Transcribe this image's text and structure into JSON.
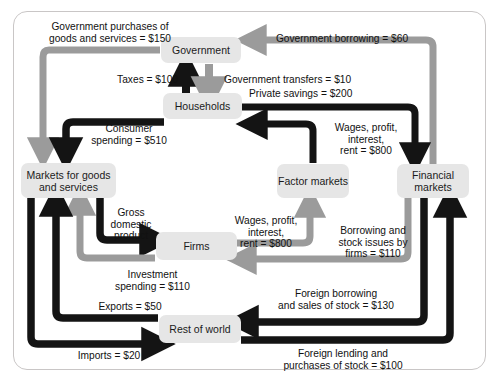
{
  "diagram": {
    "colors": {
      "dark_flow": "#141414",
      "gray_flow": "#9b9b9b",
      "node_fill": "#e6e6e6",
      "border": "#c9c6c6",
      "text": "#111111"
    },
    "nodes": [
      {
        "id": "government",
        "label": "Government"
      },
      {
        "id": "households",
        "label": "Households"
      },
      {
        "id": "markets_goods",
        "label": "Markets for goods\nand services"
      },
      {
        "id": "factor_markets",
        "label": "Factor\nmarkets"
      },
      {
        "id": "financial_markets",
        "label": "Financial\nmarkets"
      },
      {
        "id": "firms",
        "label": "Firms"
      },
      {
        "id": "rest_of_world",
        "label": "Rest of world"
      }
    ],
    "flows": [
      {
        "id": "gov_purchases",
        "label": "Government purchases of\ngoods and services = $150",
        "value": 150,
        "color": "gray",
        "from": "government",
        "to": "markets_goods"
      },
      {
        "id": "gov_borrowing",
        "label": "Government borrowing = $60",
        "value": 60,
        "color": "gray",
        "from": "financial_markets",
        "to": "government"
      },
      {
        "id": "taxes",
        "label": "Taxes = $100",
        "value": 100,
        "color": "dark",
        "from": "households",
        "to": "government"
      },
      {
        "id": "gov_transfers",
        "label": "Government transfers = $10",
        "value": 10,
        "color": "gray",
        "from": "government",
        "to": "households"
      },
      {
        "id": "private_savings",
        "label": "Private savings = $200",
        "value": 200,
        "color": "dark",
        "from": "households",
        "to": "financial_markets"
      },
      {
        "id": "consumer_spending",
        "label": "Consumer\nspending = $510",
        "value": 510,
        "color": "dark",
        "from": "households",
        "to": "markets_goods"
      },
      {
        "id": "wages_to_households",
        "label": "Wages, profit,\ninterest,\nrent = $800",
        "value": 800,
        "color": "dark",
        "from": "factor_markets",
        "to": "households"
      },
      {
        "id": "gross_domestic_product",
        "label": "Gross\ndomestic\nproduct",
        "value": null,
        "color": "dark",
        "from": "markets_goods",
        "to": "firms"
      },
      {
        "id": "wages_from_firms",
        "label": "Wages, profit,\ninterest,\nrent = $800",
        "value": 800,
        "color": "gray",
        "from": "firms",
        "to": "factor_markets"
      },
      {
        "id": "borrowing_stock_firms",
        "label": "Borrowing and\nstock issues by\nfirms = $110",
        "value": 110,
        "color": "gray",
        "from": "financial_markets",
        "to": "firms"
      },
      {
        "id": "investment_spending",
        "label": "Investment\nspending = $110",
        "value": 110,
        "color": "gray",
        "from": "firms",
        "to": "markets_goods"
      },
      {
        "id": "exports",
        "label": "Exports = $50",
        "value": 50,
        "color": "dark",
        "from": "rest_of_world",
        "to": "markets_goods"
      },
      {
        "id": "imports",
        "label": "Imports = $20",
        "value": 20,
        "color": "dark",
        "from": "markets_goods",
        "to": "rest_of_world"
      },
      {
        "id": "foreign_borrowing",
        "label": "Foreign borrowing\nand sales of stock = $130",
        "value": 130,
        "color": "dark",
        "from": "financial_markets",
        "to": "rest_of_world"
      },
      {
        "id": "foreign_lending",
        "label": "Foreign lending and\npurchases of stock = $100",
        "value": 100,
        "color": "dark",
        "from": "rest_of_world",
        "to": "financial_markets"
      }
    ]
  }
}
